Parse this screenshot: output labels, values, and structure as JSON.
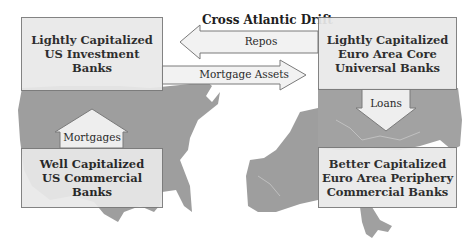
{
  "diagram": {
    "title": "Cross Atlantic Drift",
    "nodes": {
      "us_investment": {
        "line1": "Lightly Capitalized",
        "line2": "US Investment",
        "line3": "Banks"
      },
      "euro_core": {
        "line1": "Lightly Capitalized",
        "line2": "Euro Area Core",
        "line3": "Universal Banks"
      },
      "us_commercial": {
        "line1": "Well Capitalized",
        "line2": "US Commercial",
        "line3": "Banks"
      },
      "euro_periphery": {
        "line1": "Better Capitalized",
        "line2": "Euro Area Periphery",
        "line3": "Commercial Banks"
      }
    },
    "edges": {
      "repos": {
        "label": "Repos",
        "from": "euro_core",
        "to": "us_investment"
      },
      "mortgage_assets": {
        "label": "Mortgage Assets",
        "from": "us_investment",
        "to": "euro_core"
      },
      "mortgages": {
        "label": "Mortgages",
        "from": "us_commercial",
        "to": "us_investment"
      },
      "loans": {
        "label": "Loans",
        "from": "euro_core",
        "to": "euro_periphery"
      }
    },
    "colors": {
      "map": "#9a9a9a",
      "box": "#e9e9e9",
      "border": "#7a7a7a",
      "arrow": "#f2f2f2"
    }
  }
}
